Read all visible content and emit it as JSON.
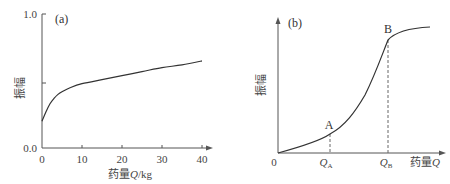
{
  "chart_data": [
    {
      "type": "line",
      "panel_label": "(a)",
      "xlabel": "药量Q/kg",
      "xlabel_parts": {
        "prefix": "药量",
        "var": "Q",
        "suffix": "/kg"
      },
      "ylabel": "振幅",
      "x_ticks": [
        "0",
        "10",
        "20",
        "30",
        "40"
      ],
      "y_ticks": [
        "0.0",
        "1.0"
      ],
      "y_mid_tick": 0.5,
      "xlim": [
        0,
        40
      ],
      "ylim": [
        0,
        1.0
      ],
      "grid": false,
      "series": [
        {
          "name": "振幅",
          "x": [
            0,
            1,
            2,
            3,
            4,
            5,
            7,
            10,
            15,
            20,
            25,
            30,
            35,
            40
          ],
          "y": [
            0.2,
            0.27,
            0.33,
            0.37,
            0.4,
            0.42,
            0.45,
            0.48,
            0.51,
            0.54,
            0.57,
            0.6,
            0.62,
            0.65
          ]
        }
      ]
    },
    {
      "type": "line",
      "panel_label": "(b)",
      "xlabel": "药量Q",
      "xlabel_parts": {
        "prefix": "药量",
        "var": "Q"
      },
      "ylabel": "振幅",
      "origin_label": "0",
      "x_ticks": [
        "Q_A",
        "Q_B"
      ],
      "x_tick_parts": [
        {
          "var": "Q",
          "sub": "A"
        },
        {
          "var": "Q",
          "sub": "B"
        }
      ],
      "grid": false,
      "annotations": [
        {
          "label": "A",
          "note": "point on curve at Q_A, dashed drop line to x-axis"
        },
        {
          "label": "B",
          "note": "point on curve at Q_B, dashed drop line to x-axis"
        }
      ],
      "series": [
        {
          "name": "振幅",
          "description": "S-shaped curve: slow rise to A, steep rise from A to B, then saturation",
          "x_rel": [
            0,
            0.31,
            0.5,
            0.66,
            0.8,
            1.0
          ],
          "y_rel": [
            0,
            0.15,
            0.45,
            0.88,
            0.95,
            0.98
          ]
        }
      ]
    }
  ]
}
